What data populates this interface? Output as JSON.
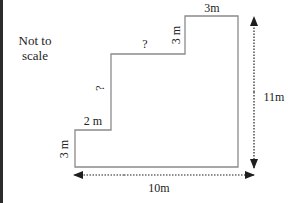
{
  "diagram": {
    "note_line1": "Not to",
    "note_line2": "scale",
    "labels": {
      "left_step_height": "3 m",
      "left_step_width": "2 m",
      "middle_rise": "?",
      "middle_run": "?",
      "upper_step_height": "3 m",
      "top_width": "3m",
      "total_height": "11m",
      "total_width": "10m"
    },
    "colors": {
      "outline": "#8a8a8a",
      "arrow": "#1e1e1e",
      "text": "#222222",
      "frame": "#2b2b2b"
    }
  }
}
